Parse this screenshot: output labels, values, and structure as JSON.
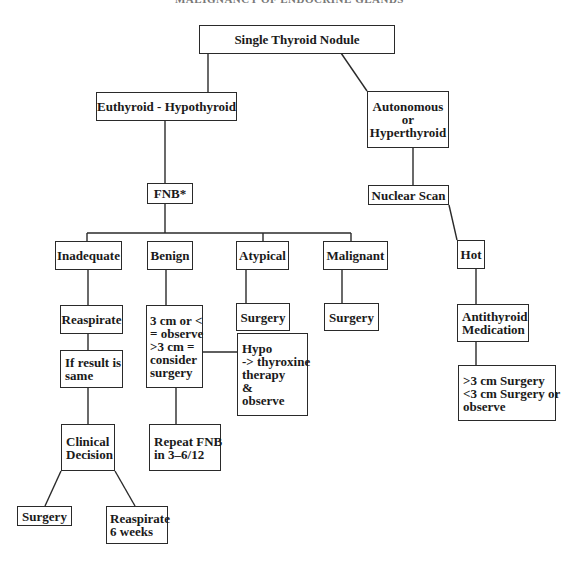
{
  "running_header": "MALIGNANCY OF ENDOCRINE GLANDS",
  "nodes": {
    "root": "Single Thyroid Nodule",
    "euthyroid": "Euthyroid - Hypothyroid",
    "autonomous": "Autonomous\nor\nHyperthyroid",
    "fnb": "FNB*",
    "nuclear_scan": "Nuclear Scan",
    "inadequate": "Inadequate",
    "benign": "Benign",
    "atypical": "Atypical",
    "malignant": "Malignant",
    "hot": "Hot",
    "reaspirate": "Reaspirate",
    "benign_size": "3 cm or <\n= observe\n>3 cm =\nconsider\nsurgery",
    "atypical_surgery": "Surgery",
    "malignant_surgery": "Surgery",
    "hypo_therapy": "Hypo\n-> thyroxine\ntherapy\n&\nobserve",
    "antithyroid": "Antithyroid\nMedication",
    "hot_size": ">3 cm Surgery\n<3 cm Surgery or\nobserve",
    "if_same": "If result is\nsame",
    "clinical_decision": "Clinical\nDecision",
    "repeat_fnb": "Repeat FNB\nin 3–6/12",
    "final_surgery": "Surgery",
    "reaspirate_6w": "Reaspirate\n6 weeks"
  }
}
